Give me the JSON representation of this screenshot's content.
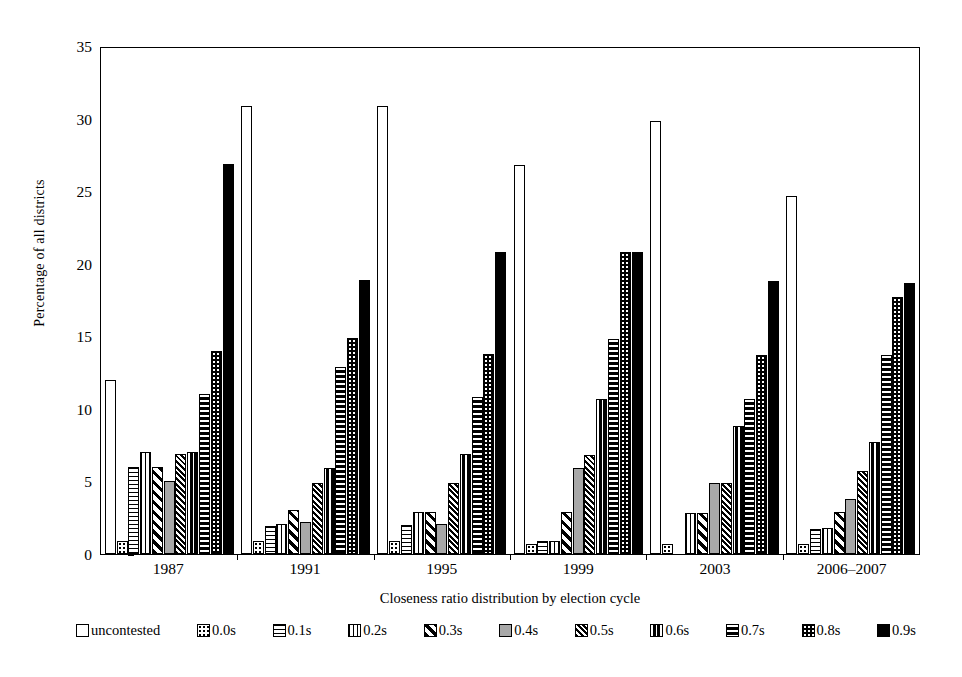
{
  "chart_data": {
    "type": "bar",
    "title": "",
    "xlabel": "Closeness ratio distribution by election cycle",
    "ylabel": "Percentage of all districts",
    "categories": [
      "1987",
      "1991",
      "1995",
      "1999",
      "2003",
      "2006–2007"
    ],
    "ylim": [
      0,
      35
    ],
    "yticks": [
      0,
      5,
      10,
      15,
      20,
      25,
      30,
      35
    ],
    "grid": false,
    "legend_position": "bottom",
    "series": [
      {
        "name": "uncontested",
        "pattern": "open-white",
        "values": [
          12.0,
          30.9,
          30.9,
          26.8,
          29.8,
          24.7
        ]
      },
      {
        "name": "0.0s",
        "pattern": "fine-dots",
        "values": [
          0.9,
          0.9,
          0.9,
          0.7,
          0.7,
          0.7
        ]
      },
      {
        "name": "0.1s",
        "pattern": "horizontal-lines",
        "values": [
          6.0,
          1.9,
          2.0,
          0.9,
          0.0,
          1.7
        ]
      },
      {
        "name": "0.2s",
        "pattern": "vertical-lines",
        "values": [
          7.0,
          2.1,
          2.9,
          0.9,
          2.8,
          1.8
        ]
      },
      {
        "name": "0.3s",
        "pattern": "diagonal-stripes",
        "values": [
          6.0,
          3.0,
          2.9,
          2.9,
          2.8,
          2.9
        ]
      },
      {
        "name": "0.4s",
        "pattern": "solid-gray",
        "values": [
          5.0,
          2.2,
          2.1,
          5.9,
          4.9,
          3.8
        ]
      },
      {
        "name": "0.5s",
        "pattern": "dense-diagonal",
        "values": [
          6.9,
          4.9,
          4.9,
          6.8,
          4.9,
          5.7
        ]
      },
      {
        "name": "0.6s",
        "pattern": "black-vertical-bands",
        "values": [
          7.0,
          5.9,
          6.9,
          10.7,
          8.8,
          7.7
        ]
      },
      {
        "name": "0.7s",
        "pattern": "black-horizontal-bands",
        "values": [
          11.0,
          12.9,
          10.8,
          14.8,
          10.7,
          13.7
        ]
      },
      {
        "name": "0.8s",
        "pattern": "black-with-white-dots",
        "values": [
          14.0,
          14.9,
          13.8,
          20.8,
          13.7,
          17.7
        ]
      },
      {
        "name": "0.9s",
        "pattern": "solid-black",
        "values": [
          26.9,
          18.9,
          20.8,
          20.8,
          18.8,
          18.7
        ]
      }
    ]
  },
  "axes": {
    "y_label": "Percentage of all districts",
    "x_label": "Closeness ratio distribution by election cycle",
    "y_ticks": [
      "0",
      "5",
      "10",
      "15",
      "20",
      "25",
      "30",
      "35"
    ],
    "x_ticks": [
      "1987",
      "1991",
      "1995",
      "1999",
      "2003",
      "2006–2007"
    ]
  },
  "legend": {
    "items": [
      {
        "label": "uncontested",
        "key": "uncontested"
      },
      {
        "label": "0.0s",
        "key": "s00"
      },
      {
        "label": "0.1s",
        "key": "s01"
      },
      {
        "label": "0.2s",
        "key": "s02"
      },
      {
        "label": "0.3s",
        "key": "s03"
      },
      {
        "label": "0.4s",
        "key": "s04"
      },
      {
        "label": "0.5s",
        "key": "s05"
      },
      {
        "label": "0.6s",
        "key": "s06"
      },
      {
        "label": "0.7s",
        "key": "s07"
      },
      {
        "label": "0.8s",
        "key": "s08"
      },
      {
        "label": "0.9s",
        "key": "s09"
      }
    ]
  },
  "colors": {
    "axis": "#000000",
    "background": "#ffffff",
    "gray_fill": "#a8a8a8",
    "black_fill": "#000000"
  }
}
